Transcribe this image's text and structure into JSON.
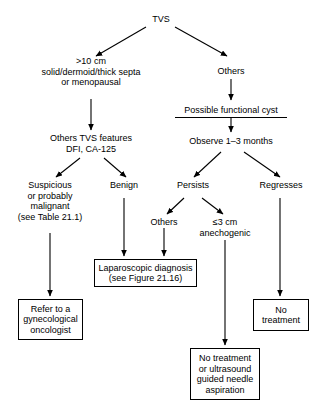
{
  "figure": {
    "type": "flowchart",
    "orientation": "top-down"
  },
  "nodes": {
    "tvs": {
      "lines": [
        "TVS"
      ]
    },
    "large_criteria": {
      "lines": [
        ">10 cm",
        "solid/dermoid/thick septa",
        "or menopausal"
      ]
    },
    "others_top": {
      "lines": [
        "Others"
      ]
    },
    "possible_functional_cyst": {
      "lines": [
        "Possible functional cyst"
      ]
    },
    "other_tvs_features": {
      "lines": [
        "Others TVS features",
        "DFI, CA-125"
      ]
    },
    "observe": {
      "lines": [
        "Observe 1–3 months"
      ]
    },
    "suspicious": {
      "lines": [
        "Suspicious",
        "or probably",
        "malignant",
        "(see Table 21.1)"
      ]
    },
    "benign": {
      "lines": [
        "Benign"
      ]
    },
    "persists": {
      "lines": [
        "Persists"
      ]
    },
    "regresses": {
      "lines": [
        "Regresses"
      ]
    },
    "others_mid": {
      "lines": [
        "Others"
      ]
    },
    "anechogenic": {
      "lines": [
        "≤3 cm",
        "anechogenic"
      ]
    },
    "laparoscopic": {
      "lines": [
        "Laparoscopic diagnosis",
        "(see Figure 21.16)"
      ]
    },
    "refer": {
      "lines": [
        "Refer to a",
        "gynecological",
        "oncologist"
      ]
    },
    "no_treatment_aspiration": {
      "lines": [
        "No treatment",
        "or ultrasound",
        "guided needle",
        "aspiration"
      ]
    },
    "no_treatment": {
      "lines": [
        "No",
        "treatment"
      ]
    }
  },
  "edges": [
    {
      "from": "tvs",
      "to": "large_criteria"
    },
    {
      "from": "tvs",
      "to": "others_top"
    },
    {
      "from": "large_criteria",
      "to": "other_tvs_features"
    },
    {
      "from": "others_top",
      "to": "possible_functional_cyst"
    },
    {
      "from": "possible_functional_cyst",
      "to": "observe"
    },
    {
      "from": "other_tvs_features",
      "to": "suspicious"
    },
    {
      "from": "other_tvs_features",
      "to": "benign"
    },
    {
      "from": "observe",
      "to": "persists"
    },
    {
      "from": "observe",
      "to": "regresses"
    },
    {
      "from": "persists",
      "to": "others_mid"
    },
    {
      "from": "persists",
      "to": "anechogenic"
    },
    {
      "from": "suspicious",
      "to": "refer"
    },
    {
      "from": "benign",
      "to": "laparoscopic"
    },
    {
      "from": "others_mid",
      "to": "laparoscopic"
    },
    {
      "from": "anechogenic",
      "to": "no_treatment_aspiration"
    },
    {
      "from": "regresses",
      "to": "no_treatment"
    }
  ],
  "colors": {
    "stroke": "#000000",
    "text": "#000000",
    "background": "#ffffff"
  }
}
